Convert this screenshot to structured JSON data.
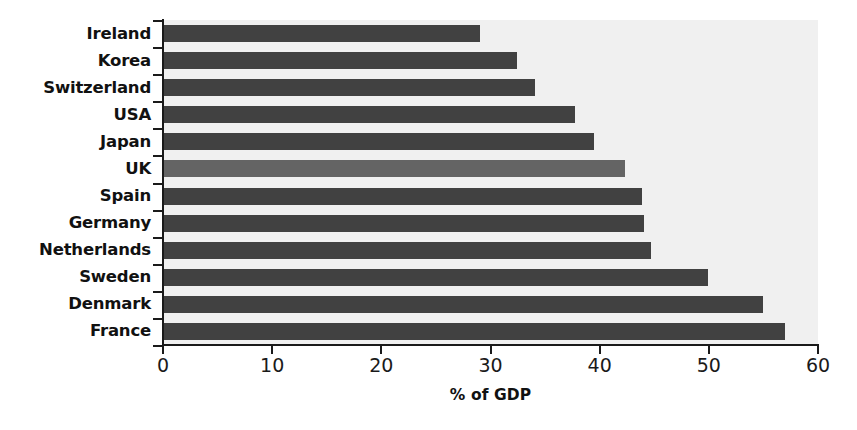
{
  "chart_data": {
    "type": "bar",
    "orientation": "horizontal",
    "title": "",
    "xlabel": "% of GDP",
    "ylabel": "",
    "xlim": [
      0,
      60
    ],
    "xticks": [
      0,
      10,
      20,
      30,
      40,
      50,
      60
    ],
    "xticklabels": [
      "0",
      "10",
      "20",
      "30",
      "40",
      "50",
      "60"
    ],
    "grid": false,
    "legend": null,
    "categories": [
      "Ireland",
      "Korea",
      "Switzerland",
      "USA",
      "Japan",
      "UK",
      "Spain",
      "Germany",
      "Netherlands",
      "Sweden",
      "Denmark",
      "France"
    ],
    "values": [
      29.0,
      32.4,
      34.1,
      37.7,
      39.5,
      42.3,
      43.9,
      44.1,
      44.7,
      49.9,
      55.0,
      57.0
    ],
    "highlight_category": "UK",
    "colors": {
      "bar": "#414141",
      "bar_highlight": "#646464",
      "plot_background": "#f0f0f0",
      "page_background": "#ffffff",
      "axis": "#1a1a1a",
      "text": "#111111"
    }
  }
}
